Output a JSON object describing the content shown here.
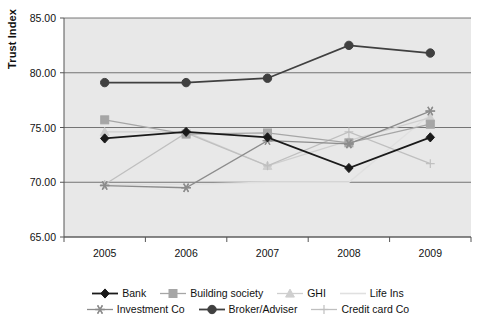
{
  "chart_data": {
    "type": "line",
    "title": "",
    "xlabel": "",
    "ylabel": "Trust Index",
    "categories": [
      "2005",
      "2006",
      "2007",
      "2008",
      "2009"
    ],
    "ylim": [
      65.0,
      85.0
    ],
    "ytick_labels": [
      "65.00",
      "70.00",
      "75.00",
      "80.00",
      "85.00"
    ],
    "ytick_values": [
      65.0,
      70.0,
      75.0,
      80.0,
      85.0
    ],
    "grid": "horizontal",
    "legend_position": "bottom",
    "plot_background": "#e8e8e8",
    "series": [
      {
        "name": "Bank",
        "marker": "diamond",
        "color": "#1a1a1a",
        "values": [
          74.0,
          74.6,
          74.1,
          71.3,
          74.1
        ]
      },
      {
        "name": "Building society",
        "marker": "square",
        "color": "#a6a6a6",
        "values": [
          75.7,
          74.4,
          74.5,
          73.6,
          75.3
        ]
      },
      {
        "name": "GHI",
        "marker": "triangle",
        "color": "#cfcfcf",
        "values": [
          74.6,
          74.6,
          71.5,
          73.8,
          75.9
        ]
      },
      {
        "name": "Life Ins",
        "marker": "none",
        "color": "#e0e0e0",
        "values": [
          69.8,
          69.8,
          70.0,
          70.0,
          76.2
        ]
      },
      {
        "name": "Investment Co",
        "marker": "star",
        "color": "#8c8c8c",
        "values": [
          69.7,
          69.5,
          73.8,
          73.5,
          76.5
        ]
      },
      {
        "name": "Broker/Adviser",
        "marker": "circle",
        "color": "#404040",
        "values": [
          79.1,
          79.1,
          79.5,
          82.5,
          81.8
        ]
      },
      {
        "name": "Credit card Co",
        "marker": "plus",
        "color": "#bfbfbf",
        "values": [
          69.8,
          74.5,
          71.5,
          74.6,
          71.7
        ]
      }
    ]
  },
  "legend": {
    "row1": [
      "Bank",
      "Building society",
      "GHI",
      "Life Ins"
    ],
    "row2": [
      "Investment Co",
      "Broker/Adviser",
      "Credit card Co"
    ]
  }
}
